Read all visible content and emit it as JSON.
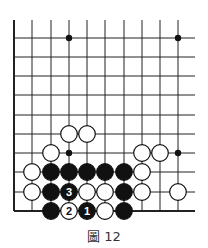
{
  "caption": "圖 12",
  "board": {
    "cols_x": [
      14,
      32,
      51,
      69,
      87,
      105,
      124,
      142,
      160,
      178
    ],
    "rows_y": [
      38,
      57,
      76,
      95,
      115,
      134,
      153,
      172,
      192,
      211
    ],
    "top_stub_y": 20,
    "right_end_x": 195,
    "hoshi": [
      [
        3,
        0
      ],
      [
        9,
        0
      ],
      [
        3,
        6
      ],
      [
        9,
        6
      ]
    ],
    "stones": [
      {
        "color": "white",
        "col": 3,
        "row": 5
      },
      {
        "color": "white",
        "col": 4,
        "row": 5
      },
      {
        "color": "white",
        "col": 2,
        "row": 6
      },
      {
        "color": "white",
        "col": 7,
        "row": 6
      },
      {
        "color": "white",
        "col": 8,
        "row": 6
      },
      {
        "color": "white",
        "col": 1,
        "row": 7
      },
      {
        "color": "black",
        "col": 2,
        "row": 7
      },
      {
        "color": "black",
        "col": 3,
        "row": 7
      },
      {
        "color": "black",
        "col": 4,
        "row": 7
      },
      {
        "color": "black",
        "col": 5,
        "row": 7
      },
      {
        "color": "black",
        "col": 6,
        "row": 7
      },
      {
        "color": "white",
        "col": 7,
        "row": 7
      },
      {
        "color": "white",
        "col": 1,
        "row": 8
      },
      {
        "color": "black",
        "col": 2,
        "row": 8
      },
      {
        "color": "black",
        "col": 3,
        "row": 8,
        "label": "3"
      },
      {
        "color": "white",
        "col": 4,
        "row": 8
      },
      {
        "color": "white",
        "col": 5,
        "row": 8
      },
      {
        "color": "black",
        "col": 6,
        "row": 8
      },
      {
        "color": "white",
        "col": 7,
        "row": 8
      },
      {
        "color": "white",
        "col": 9,
        "row": 8
      },
      {
        "color": "black",
        "col": 2,
        "row": 9
      },
      {
        "color": "white",
        "col": 3,
        "row": 9,
        "label": "2"
      },
      {
        "color": "black",
        "col": 4,
        "row": 9,
        "label": "1"
      },
      {
        "color": "white",
        "col": 5,
        "row": 9
      },
      {
        "color": "black",
        "col": 6,
        "row": 9
      }
    ]
  }
}
